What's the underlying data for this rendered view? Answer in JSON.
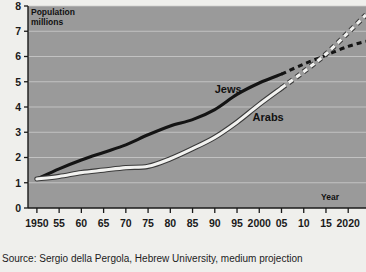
{
  "chart_data": {
    "type": "line",
    "title": "",
    "ylabel": "Population millions",
    "xlabel": "Year",
    "ylim": [
      0,
      8
    ],
    "xlim": [
      1948,
      2024
    ],
    "grid": true,
    "legend_position": "inline-labels",
    "yticks": [
      "0",
      "1",
      "2",
      "3",
      "4",
      "5",
      "6",
      "7",
      "8"
    ],
    "ytick_values": [
      0,
      1,
      2,
      3,
      4,
      5,
      6,
      7,
      8
    ],
    "xticks": [
      "1950",
      "55",
      "60",
      "65",
      "70",
      "75",
      "80",
      "85",
      "90",
      "95",
      "2000",
      "05",
      "10",
      "15",
      "2020"
    ],
    "xtick_values": [
      1950,
      1955,
      1960,
      1965,
      1970,
      1975,
      1980,
      1985,
      1990,
      1995,
      2000,
      2005,
      2010,
      2015,
      2020
    ],
    "projection_starts_at": 2005,
    "series": [
      {
        "name": "Jews",
        "color": "#141414",
        "x": [
          1950,
          1955,
          1960,
          1965,
          1970,
          1975,
          1980,
          1985,
          1990,
          1995,
          2000,
          2005,
          2010,
          2015,
          2020,
          2024
        ],
        "values": [
          1.15,
          1.55,
          1.9,
          2.2,
          2.5,
          2.9,
          3.25,
          3.5,
          3.9,
          4.5,
          4.95,
          5.3,
          5.7,
          6.05,
          6.4,
          6.6
        ]
      },
      {
        "name": "Arabs",
        "color": "#f2f2f0",
        "x": [
          1950,
          1955,
          1960,
          1965,
          1970,
          1975,
          1980,
          1985,
          1990,
          1995,
          2000,
          2005,
          2010,
          2015,
          2020,
          2024
        ],
        "values": [
          1.15,
          1.25,
          1.4,
          1.5,
          1.6,
          1.65,
          1.95,
          2.35,
          2.8,
          3.4,
          4.1,
          4.75,
          5.4,
          6.1,
          6.95,
          7.65
        ]
      }
    ],
    "annotations": [
      {
        "text": "Jews",
        "x": 1993,
        "y": 4.55
      },
      {
        "text": "Arabs",
        "x": 2002,
        "y": 3.45
      }
    ]
  },
  "source": {
    "text": "Source: Sergio della Pergola, Hebrew University, medium projection"
  },
  "colors": {
    "plot_background": "#9a9a9a",
    "page_background": "#efefec",
    "grid": "#cfcfcf",
    "axis": "#1a1a1a",
    "jews_line": "#141414",
    "arabs_line": "#f2f2f0"
  }
}
